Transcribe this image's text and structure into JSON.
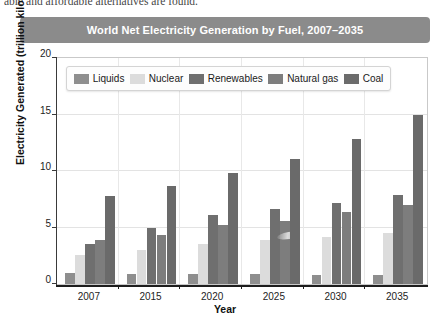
{
  "page_text": {
    "cut_off_line": "able and affordable alternatives are found."
  },
  "figure": {
    "title": "World Net Electricity Generation by Fuel, 2007–2035",
    "title_bar_color": "#8b8b8b"
  },
  "chart_data": {
    "type": "bar",
    "title": "World Net Electricity Generation by Fuel, 2007–2035",
    "xlabel": "Year",
    "ylabel": "Electricity Generated (trillion kilowatt-hours)",
    "categories": [
      "2007",
      "2015",
      "2020",
      "2025",
      "2030",
      "2035"
    ],
    "ylim": [
      0,
      20
    ],
    "yticks": [
      0,
      5,
      10,
      15,
      20
    ],
    "ytick_labels": [
      "0",
      "5",
      "10",
      "15",
      "20"
    ],
    "grid": true,
    "legend_position": "top-inside",
    "series": [
      {
        "name": "Liquids",
        "color": "#8e8e8e",
        "values": [
          1.0,
          0.9,
          0.9,
          0.9,
          0.8,
          0.8
        ]
      },
      {
        "name": "Nuclear",
        "color": "#dcdcdc",
        "values": [
          2.6,
          3.0,
          3.5,
          3.9,
          4.2,
          4.5
        ]
      },
      {
        "name": "Renewables",
        "color": "#6f6f6f",
        "values": [
          3.5,
          5.0,
          6.1,
          6.6,
          7.2,
          7.9
        ]
      },
      {
        "name": "Natural gas",
        "color": "#7d7d7d",
        "values": [
          3.9,
          4.3,
          5.2,
          5.6,
          6.4,
          7.0
        ]
      },
      {
        "name": "Coal",
        "color": "#6a6a6a",
        "values": [
          7.8,
          8.7,
          9.8,
          11.1,
          12.8,
          15.0
        ]
      }
    ]
  }
}
